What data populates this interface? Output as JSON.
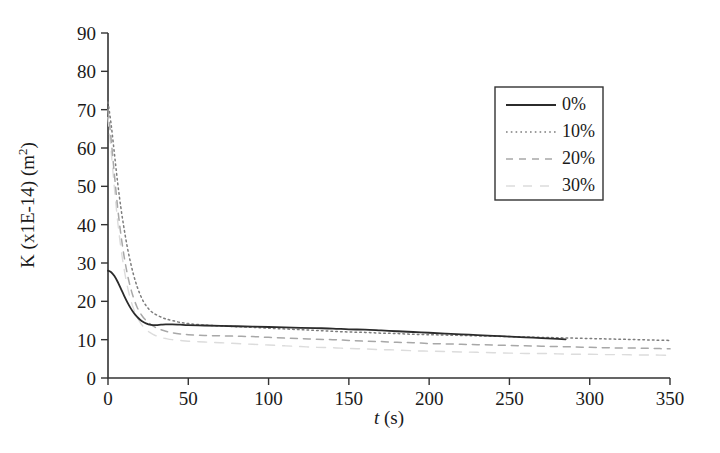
{
  "chart_data": {
    "type": "line",
    "title": "",
    "xlabel": "t (s)",
    "ylabel": "K (x1E-14)  (m2)",
    "ylabel_parts": {
      "main": "K (x1E-14)  (m",
      "sup": "2",
      "tail": ")"
    },
    "xlabel_parts": {
      "ital": "t",
      "rest": " (s)"
    },
    "xlim": [
      0,
      350
    ],
    "ylim": [
      0,
      90
    ],
    "xticks": [
      0,
      50,
      100,
      150,
      200,
      250,
      300,
      350
    ],
    "yticks": [
      0,
      10,
      20,
      30,
      40,
      50,
      60,
      70,
      80,
      90
    ],
    "grid": false,
    "legend_position": "upper-right",
    "legend_entries": [
      "0%",
      "10%",
      "20%",
      "30%"
    ],
    "series": [
      {
        "name": "0%",
        "style": "solid",
        "color": "#2b2b2b",
        "width": 1.8,
        "x": [
          0,
          2,
          4,
          6,
          8,
          10,
          12,
          14,
          16,
          18,
          20,
          22,
          24,
          26,
          28,
          30,
          33,
          36,
          40,
          45,
          50,
          60,
          70,
          80,
          90,
          100,
          110,
          120,
          130,
          140,
          150,
          160,
          170,
          180,
          190,
          200,
          210,
          220,
          230,
          240,
          250,
          260,
          270,
          280,
          285
        ],
        "y": [
          28.0,
          27.6,
          26.6,
          25.1,
          23.3,
          21.5,
          19.8,
          18.3,
          17.0,
          16.0,
          15.2,
          14.6,
          14.2,
          13.9,
          13.8,
          13.8,
          13.9,
          14.0,
          14.0,
          13.9,
          13.8,
          13.7,
          13.6,
          13.5,
          13.4,
          13.3,
          13.2,
          13.1,
          13.0,
          12.9,
          12.7,
          12.6,
          12.4,
          12.2,
          12.0,
          11.8,
          11.6,
          11.4,
          11.2,
          11.0,
          10.8,
          10.6,
          10.4,
          10.2,
          10.1
        ]
      },
      {
        "name": "10%",
        "style": "dotted",
        "color": "#7d7d7d",
        "width": 1.5,
        "x": [
          0,
          2,
          4,
          6,
          8,
          10,
          12,
          14,
          16,
          18,
          20,
          22,
          24,
          26,
          28,
          30,
          33,
          36,
          40,
          45,
          50,
          60,
          70,
          80,
          90,
          100,
          110,
          120,
          130,
          140,
          150,
          160,
          170,
          180,
          190,
          200,
          210,
          220,
          230,
          240,
          250,
          260,
          270,
          280,
          290,
          300,
          310,
          320,
          330,
          340,
          350
        ],
        "y": [
          72.0,
          66.0,
          58.5,
          51.0,
          44.5,
          39.0,
          34.2,
          30.2,
          26.8,
          24.0,
          21.8,
          20.0,
          18.7,
          17.7,
          17.0,
          16.5,
          15.9,
          15.4,
          15.0,
          14.5,
          14.2,
          13.8,
          13.6,
          13.4,
          13.2,
          13.0,
          12.8,
          12.6,
          12.4,
          12.2,
          12.0,
          11.9,
          11.7,
          11.6,
          11.4,
          11.3,
          11.2,
          11.1,
          11.0,
          10.9,
          10.8,
          10.7,
          10.6,
          10.5,
          10.4,
          10.3,
          10.2,
          10.1,
          10.0,
          9.9,
          9.8
        ]
      },
      {
        "name": "20%",
        "style": "dashed",
        "color": "#a8a8a8",
        "width": 1.5,
        "x": [
          0,
          2,
          4,
          6,
          8,
          10,
          12,
          14,
          16,
          18,
          20,
          22,
          24,
          26,
          28,
          30,
          33,
          36,
          40,
          45,
          50,
          60,
          70,
          80,
          90,
          100,
          110,
          120,
          130,
          140,
          150,
          160,
          170,
          180,
          190,
          200,
          210,
          220,
          230,
          240,
          250,
          260,
          270,
          280,
          290,
          300,
          310,
          320,
          330,
          340,
          350
        ],
        "y": [
          70.0,
          62.0,
          53.0,
          44.5,
          37.5,
          31.8,
          27.2,
          23.6,
          20.8,
          18.6,
          17.0,
          15.8,
          14.9,
          14.2,
          13.6,
          13.1,
          12.6,
          12.2,
          11.8,
          11.5,
          11.3,
          11.1,
          11.0,
          10.9,
          10.8,
          10.6,
          10.4,
          10.3,
          10.1,
          10.0,
          9.8,
          9.6,
          9.5,
          9.3,
          9.2,
          9.0,
          8.9,
          8.8,
          8.7,
          8.6,
          8.5,
          8.4,
          8.3,
          8.2,
          8.1,
          8.0,
          7.9,
          7.8,
          7.8,
          7.7,
          7.6
        ]
      },
      {
        "name": "30%",
        "style": "faint-dashed",
        "color": "#dcdcdc",
        "width": 1.4,
        "x": [
          0,
          2,
          4,
          6,
          8,
          10,
          12,
          14,
          16,
          18,
          20,
          22,
          24,
          26,
          28,
          30,
          33,
          36,
          40,
          45,
          50,
          60,
          70,
          80,
          90,
          100,
          110,
          120,
          130,
          140,
          150,
          160,
          170,
          180,
          190,
          200,
          210,
          220,
          230,
          240,
          250,
          260,
          270,
          280,
          290,
          300,
          310,
          320,
          330,
          340,
          350
        ],
        "y": [
          68.0,
          59.0,
          49.5,
          41.0,
          34.0,
          28.5,
          24.0,
          20.6,
          18.0,
          16.0,
          14.5,
          13.4,
          12.5,
          11.9,
          11.4,
          11.0,
          10.6,
          10.3,
          10.0,
          9.8,
          9.6,
          9.4,
          9.2,
          9.0,
          8.8,
          8.6,
          8.4,
          8.2,
          8.0,
          7.9,
          7.7,
          7.6,
          7.4,
          7.3,
          7.1,
          7.0,
          6.9,
          6.8,
          6.7,
          6.6,
          6.5,
          6.4,
          6.4,
          6.3,
          6.2,
          6.2,
          6.1,
          6.1,
          6.0,
          6.0,
          5.9
        ]
      }
    ]
  }
}
